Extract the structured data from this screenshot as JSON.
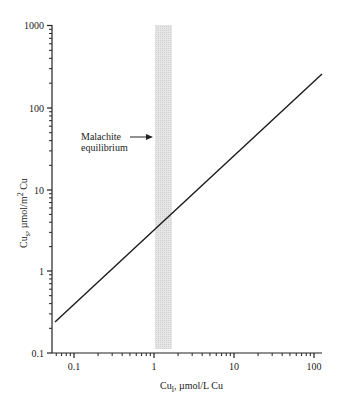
{
  "chart_data": {
    "type": "line",
    "title": "",
    "xlabel": "Cu_l, µmol/L Cu",
    "ylabel": "Cu_s, µmol/m² Cu",
    "xscale": "log",
    "yscale": "log",
    "xlim": [
      0.055,
      130
    ],
    "ylim": [
      0.1,
      1000
    ],
    "x_ticks": [
      "0.1",
      "1",
      "10",
      "100"
    ],
    "y_ticks": [
      "0.1",
      "1",
      "10",
      "100",
      "1000"
    ],
    "grid": false,
    "legend": null,
    "series": [
      {
        "name": "Cu sorption isotherm",
        "x": [
          0.058,
          0.1,
          1,
          10,
          126
        ],
        "y": [
          0.23,
          0.37,
          3.6,
          33,
          245
        ],
        "color": "#222222"
      }
    ],
    "shaded_band": {
      "label": "Malachite equilibrium",
      "x_range": [
        1.0,
        1.6
      ],
      "color": "#d8d8d8"
    },
    "annotations": [
      {
        "text_line1": "Malachite",
        "text_line2": "equilibrium",
        "arrow_to": "shaded_band"
      }
    ]
  },
  "labels": {
    "xlabel_main": "Cu",
    "xlabel_sub": "l",
    "xlabel_rest": ", µmol/L Cu",
    "ylabel_main": "Cu",
    "ylabel_sub": "s",
    "ylabel_rest": ", µmol/m",
    "ylabel_sup": "2",
    "ylabel_end": " Cu",
    "annot_line1": "Malachite",
    "annot_line2": "equilibrium",
    "xticks": [
      "0.1",
      "1",
      "10",
      "100"
    ],
    "yticks": [
      "0.1",
      "1",
      "10",
      "100",
      "1000"
    ]
  }
}
